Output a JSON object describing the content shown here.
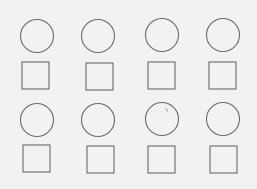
{
  "figure": {
    "background": "#f2f2f1",
    "stroke_color": "#6a6a6a",
    "rows": [
      {
        "cells": [
          {
            "circle": {
              "cx": 37,
              "cy": 36,
              "r": 16.5
            },
            "square": {
              "x": 22,
              "y": 62,
              "size": 27
            }
          },
          {
            "circle": {
              "cx": 98,
              "cy": 36,
              "r": 16.5
            },
            "square": {
              "x": 86,
              "y": 63,
              "size": 27
            }
          },
          {
            "circle": {
              "cx": 162,
              "cy": 35,
              "r": 16.5
            },
            "square": {
              "x": 148,
              "y": 62,
              "size": 27
            }
          },
          {
            "circle": {
              "cx": 223,
              "cy": 35,
              "r": 16.5
            },
            "square": {
              "x": 209,
              "y": 62,
              "size": 27
            }
          }
        ]
      },
      {
        "cells": [
          {
            "circle": {
              "cx": 37,
              "cy": 120,
              "r": 16.5
            },
            "square": {
              "x": 23,
              "y": 145,
              "size": 27
            }
          },
          {
            "circle": {
              "cx": 98,
              "cy": 120,
              "r": 16.5
            },
            "square": {
              "x": 87,
              "y": 146,
              "size": 27
            }
          },
          {
            "circle": {
              "cx": 162,
              "cy": 119,
              "r": 16.5
            },
            "square": {
              "x": 148,
              "y": 146,
              "size": 27
            }
          },
          {
            "circle": {
              "cx": 223,
              "cy": 119,
              "r": 16.5
            },
            "square": {
              "x": 210,
              "y": 146,
              "size": 27
            }
          }
        ]
      }
    ],
    "annotation": {
      "description": "small pencil tick inside row-2 circle 3",
      "x1": 166,
      "y1": 108,
      "x2": 168,
      "y2": 111
    }
  }
}
